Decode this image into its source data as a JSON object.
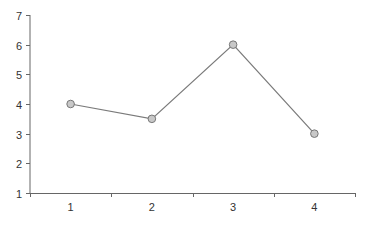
{
  "chart_data": {
    "type": "line",
    "title": "",
    "xlabel": "",
    "ylabel": "",
    "categories": [
      "1",
      "2",
      "3",
      "4"
    ],
    "series": [
      {
        "name": "Series 1",
        "values": [
          4,
          3.5,
          6,
          3
        ]
      }
    ],
    "ylim": [
      1,
      7
    ],
    "yticks": [
      "1",
      "2",
      "3",
      "4",
      "5",
      "6",
      "7"
    ],
    "grid": false,
    "legend": "none",
    "colors": {
      "line": "#7a7a7a",
      "marker_fill": "#c8c8c8",
      "marker_stroke": "#777777",
      "axis": "#666666"
    }
  }
}
